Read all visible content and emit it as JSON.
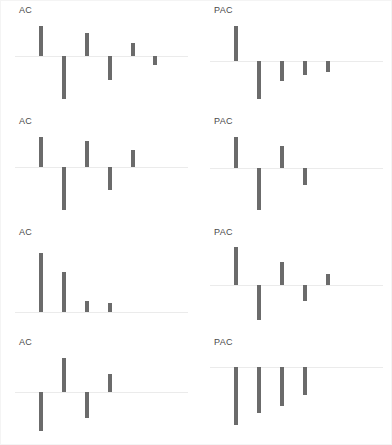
{
  "figure": {
    "background_color": "#ffffff",
    "border_color": "#f4f4f4",
    "bar_color": "#6b6b6b",
    "axis_color": "#ebebeb",
    "label_color": "#4a4a4a",
    "rows": 4,
    "columns": 2
  },
  "labels": {
    "ac": "AC",
    "pac": "PAC"
  },
  "chart_data": [
    {
      "type": "bar",
      "title": "AC",
      "panel_row": 1,
      "panel_col": 1,
      "xlabel": "",
      "ylabel": "",
      "grid": false,
      "legend": "none",
      "baseline": 0,
      "ylim": [
        -1,
        1
      ],
      "categories": [
        1,
        2,
        3,
        4,
        5,
        6
      ],
      "values": [
        0.62,
        -0.86,
        0.47,
        -0.48,
        0.27,
        -0.17
      ]
    },
    {
      "type": "bar",
      "title": "PAC",
      "panel_row": 1,
      "panel_col": 2,
      "xlabel": "",
      "ylabel": "",
      "grid": false,
      "legend": "none",
      "baseline": 0,
      "ylim": [
        -1,
        1
      ],
      "categories": [
        1,
        2,
        3,
        4,
        5
      ],
      "values": [
        0.79,
        -0.86,
        -0.46,
        -0.33,
        -0.25
      ]
    },
    {
      "type": "bar",
      "title": "AC",
      "panel_row": 2,
      "panel_col": 1,
      "xlabel": "",
      "ylabel": "",
      "grid": false,
      "legend": "none",
      "baseline": 0,
      "ylim": [
        -1,
        1
      ],
      "categories": [
        1,
        2,
        3,
        4,
        5
      ],
      "values": [
        0.57,
        -0.82,
        0.48,
        -0.45,
        0.31
      ]
    },
    {
      "type": "bar",
      "title": "PAC",
      "panel_row": 2,
      "panel_col": 2,
      "xlabel": "",
      "ylabel": "",
      "grid": false,
      "legend": "none",
      "baseline": 0,
      "ylim": [
        -1,
        1
      ],
      "categories": [
        1,
        2,
        3,
        4
      ],
      "values": [
        0.65,
        -0.84,
        0.46,
        -0.33
      ]
    },
    {
      "type": "bar",
      "title": "AC",
      "panel_row": 3,
      "panel_col": 1,
      "xlabel": "",
      "ylabel": "",
      "grid": false,
      "legend": "none",
      "baseline": 0,
      "ylim": [
        -1,
        1
      ],
      "categories": [
        1,
        2,
        3,
        4
      ],
      "values": [
        0.92,
        0.62,
        0.17,
        0.14
      ]
    },
    {
      "type": "bar",
      "title": "PAC",
      "panel_row": 3,
      "panel_col": 2,
      "xlabel": "",
      "ylabel": "",
      "grid": false,
      "legend": "none",
      "baseline": 0,
      "ylim": [
        -1,
        1
      ],
      "categories": [
        1,
        2,
        3,
        4,
        5
      ],
      "values": [
        0.62,
        -0.58,
        0.38,
        -0.27,
        0.19
      ]
    },
    {
      "type": "bar",
      "title": "AC",
      "panel_row": 4,
      "panel_col": 1,
      "xlabel": "",
      "ylabel": "",
      "grid": false,
      "legend": "none",
      "baseline": 0,
      "ylim": [
        -1,
        1
      ],
      "categories": [
        1,
        2,
        3,
        4
      ],
      "values": [
        -0.66,
        0.58,
        -0.43,
        0.31
      ]
    },
    {
      "type": "bar",
      "title": "PAC",
      "panel_row": 4,
      "panel_col": 2,
      "xlabel": "",
      "ylabel": "",
      "grid": false,
      "legend": "none",
      "baseline": 0,
      "ylim": [
        -1,
        1
      ],
      "categories": [
        1,
        2,
        3,
        4
      ],
      "values": [
        -0.78,
        -0.62,
        -0.52,
        -0.38
      ]
    }
  ]
}
